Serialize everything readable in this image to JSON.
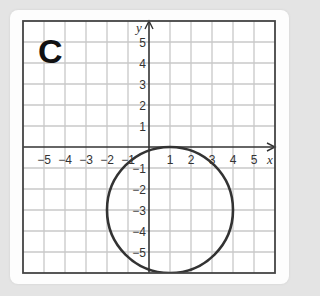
{
  "panel": {
    "label": "C"
  },
  "chart_data": {
    "type": "scatter",
    "title": "C",
    "xlabel": "x",
    "ylabel": "y",
    "xlim": [
      -6,
      6
    ],
    "ylim": [
      -6,
      6
    ],
    "grid": true,
    "x_ticks": [
      -5,
      -4,
      -3,
      -2,
      -1,
      1,
      2,
      3,
      4,
      5
    ],
    "y_ticks": [
      -5,
      -4,
      -3,
      -2,
      -1,
      1,
      2,
      3,
      4,
      5
    ],
    "x_tick_labels": [
      "−5",
      "−4",
      "−3",
      "−2",
      "−1",
      "1",
      "2",
      "3",
      "4",
      "5"
    ],
    "y_tick_labels_positive": [
      "5",
      "4",
      "3",
      "2",
      "1"
    ],
    "y_tick_labels_negative": [
      "−1",
      "−2",
      "−3",
      "−4",
      "−5"
    ],
    "series": [
      {
        "name": "circle",
        "shape": "circle",
        "center": [
          1,
          -3
        ],
        "radius": 3,
        "color": "#333333"
      }
    ]
  },
  "colors": {
    "grid": "#c8c8c8",
    "axis": "#333333",
    "frame": "#444444",
    "background": "#e4e4e4",
    "card": "#fdfdfd"
  }
}
